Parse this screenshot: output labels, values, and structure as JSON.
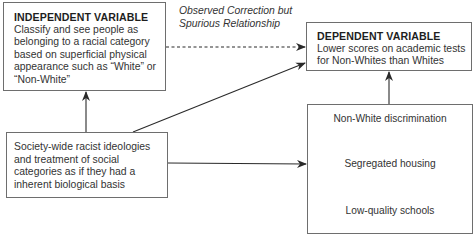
{
  "independent_variable": {
    "title": "INDEPENDENT VARIABLE",
    "lines": [
      "Classify and see people as",
      "belonging to a racial category",
      "based on superficial physical",
      "appearance such as “White” or",
      "“Non-White”"
    ]
  },
  "dependent_variable": {
    "title": "DEPENDENT VARIABLE",
    "lines": [
      "Lower scores on academic tests",
      "for Non-Whites than Whites"
    ]
  },
  "annotation": {
    "lines": [
      "Observed Correction but",
      "Spurious Relationship"
    ]
  },
  "root_cause": {
    "lines": [
      "Society-wide racist ideologies",
      "and treatment of social",
      "categories as if they had a",
      "inherent biological basis"
    ]
  },
  "causal_chain": {
    "steps": [
      "Non-White discrimination",
      "Segregated housing",
      "Low-quality schools"
    ]
  },
  "colors": {
    "line": "#2a2a2a",
    "box_border": "#6e6e6e",
    "text": "#2a2a2a"
  }
}
